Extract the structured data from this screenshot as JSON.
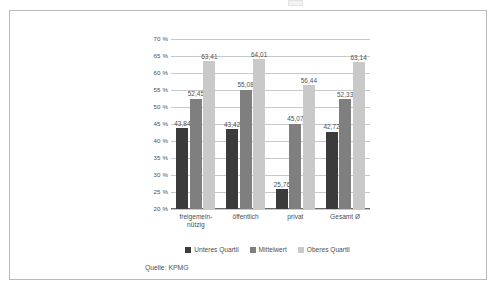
{
  "figure": {
    "source_note": "Quelle: KPMG"
  },
  "chart_data": {
    "type": "bar",
    "title": "",
    "xlabel": "",
    "ylabel": "",
    "ylim": [
      20,
      70
    ],
    "ytick_step": 5,
    "ytick_labels": [
      "70 %",
      "65 %",
      "60 %",
      "55 %",
      "50 %",
      "45 %",
      "40 %",
      "35 %",
      "30 %",
      "25 %",
      "20 %"
    ],
    "ytick_values": [
      70,
      65,
      60,
      55,
      50,
      45,
      40,
      35,
      30,
      25,
      20
    ],
    "grid": true,
    "legend_position": "bottom",
    "value_format": "comma-decimal",
    "categories": [
      "freigemein-\nnützig",
      "öffentlich",
      "privat",
      "Gesamt Ø"
    ],
    "categories_display": [
      {
        "line1": "freigemein-",
        "line2": "nützig"
      },
      {
        "line1": "öffentlich",
        "line2": ""
      },
      {
        "line1": "privat",
        "line2": ""
      },
      {
        "line1": "Gesamt Ø",
        "line2": ""
      }
    ],
    "series": [
      {
        "name": "Unteres Quartil",
        "color": "#3b3b3b",
        "values": [
          43.84,
          43.42,
          25.76,
          42.72
        ],
        "labels": [
          "43,84",
          "43,42",
          "25,76",
          "42,72"
        ]
      },
      {
        "name": "Mittelwert",
        "color": "#7f7f7f",
        "values": [
          52.45,
          55.08,
          45.07,
          52.33
        ],
        "labels": [
          "52,45",
          "55,08",
          "45,07",
          "52,33"
        ]
      },
      {
        "name": "Oberes Quartil",
        "color": "#c9c9c9",
        "values": [
          63.41,
          64.01,
          56.44,
          63.14
        ],
        "labels": [
          "63,41",
          "64,01",
          "56,44",
          "63,14"
        ]
      }
    ]
  }
}
